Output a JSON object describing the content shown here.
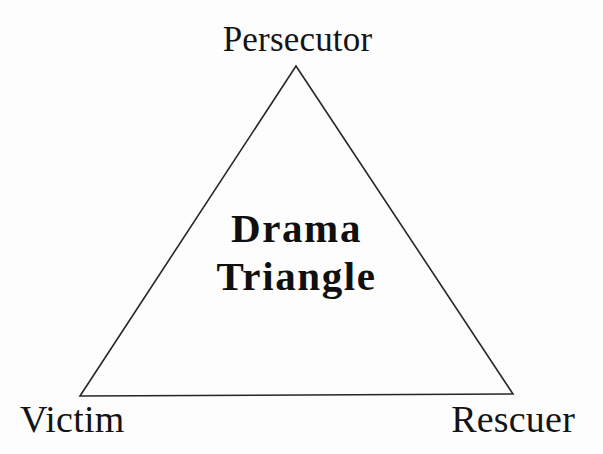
{
  "diagram": {
    "title": "Drama Triangle",
    "background_color": "#fdfdfd",
    "stroke_color": "#262626",
    "text_color": "#141414",
    "center_caption": {
      "line1": "Drama",
      "line2": "Triangle"
    },
    "vertices": [
      {
        "id": "persecutor",
        "label": "Persecutor",
        "position": "top"
      },
      {
        "id": "victim",
        "label": "Victim",
        "position": "bottom-left"
      },
      {
        "id": "rescuer",
        "label": "Rescuer",
        "position": "bottom-right"
      }
    ],
    "shape": {
      "type": "triangle",
      "apex": {
        "x": 296,
        "y": 66
      },
      "bottom_left": {
        "x": 80,
        "y": 396
      },
      "bottom_right": {
        "x": 513,
        "y": 394
      },
      "stroke_width": 1.6,
      "fill": "none"
    }
  }
}
